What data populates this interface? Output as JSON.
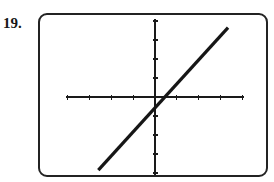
{
  "figure": {
    "problem_number": "19.",
    "caption": "Graphing calculator screen showing the graph of a line"
  },
  "screen": {
    "border_color": "#232323",
    "background_color": "#ffffff",
    "corner_radius": 9
  },
  "chart_data": {
    "type": "line",
    "title": "",
    "subtitle": "",
    "xlabel": "",
    "ylabel": "",
    "grid": false,
    "legend": null,
    "axis_color": "#1a1a1a",
    "curve_color": "#161616",
    "curve_width": 3.2,
    "axis_width": 1.2,
    "tick_length": 5,
    "xlim": [
      -5,
      5
    ],
    "ylim": [
      -4,
      4
    ],
    "xticks": [
      -4,
      -3,
      -2,
      -1,
      0,
      1,
      2,
      3,
      4
    ],
    "yticks": [
      -4,
      -3,
      -2,
      -1,
      0,
      1,
      2,
      3,
      4
    ],
    "xtick_labels": [],
    "ytick_labels": [],
    "series": [
      {
        "name": "line",
        "kind": "line",
        "x": [
          -2.6,
          3.35
        ],
        "y": [
          -3.85,
          3.65
        ],
        "slope": 1.26,
        "y_intercept": -0.58,
        "x_intercept": 0.46
      }
    ],
    "annotations": []
  }
}
